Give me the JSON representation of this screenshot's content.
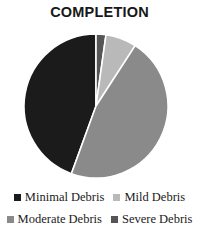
{
  "chart_data": {
    "type": "pie",
    "title": "COMPLETION",
    "categories": [
      "Minimal Debris",
      "Mild Debris",
      "Moderate Debris",
      "Severe Debris"
    ],
    "values": [
      44,
      7,
      46,
      3
    ],
    "unit": "percent",
    "slice_colors": [
      "#1b1b1b",
      "#b9b9b9",
      "#8a8a8a",
      "#555555"
    ],
    "start_angle_deg": 0,
    "direction": "clockwise",
    "slice_separator_color": "#ffffff",
    "legend_position": "bottom",
    "grid": false,
    "xlabel": "",
    "ylabel": "",
    "data_labels_shown": false,
    "slices": [
      {
        "label": "Minimal Debris",
        "value": 44,
        "color": "#1b1b1b",
        "start_deg": 200,
        "end_deg": 360
      },
      {
        "label": "Severe Debris",
        "value": 3,
        "color": "#555555",
        "start_deg": 0,
        "end_deg": 8
      },
      {
        "label": "Mild Debris",
        "value": 7,
        "color": "#b9b9b9",
        "start_deg": 8,
        "end_deg": 33
      },
      {
        "label": "Moderate Debris",
        "value": 46,
        "color": "#8a8a8a",
        "start_deg": 33,
        "end_deg": 200
      }
    ]
  },
  "title": "COMPLETION",
  "legend": {
    "row1": [
      {
        "label": "Minimal Debris",
        "color": "#1b1b1b"
      },
      {
        "label": "Mild Debris",
        "color": "#b9b9b9"
      }
    ],
    "row2": [
      {
        "label": "Moderate Debris",
        "color": "#8a8a8a"
      },
      {
        "label": "Severe Debris",
        "color": "#555555"
      }
    ]
  }
}
